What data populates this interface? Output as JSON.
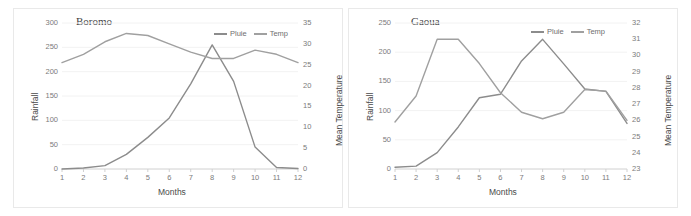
{
  "page": {
    "background_color": "#ffffff",
    "panel_border_color": "#e9e9e9"
  },
  "legend_common": {
    "series_1_label": "Pluie",
    "series_2_label": "Temp"
  },
  "axis_labels": {
    "x": "Months",
    "y_left": "Rainfall",
    "y_right": "Mean Temperature"
  },
  "chart_data": [
    {
      "type": "line",
      "title": "Boromo",
      "xlabel": "Months",
      "ylabel": "Rainfall",
      "y2label": "Mean Temperature",
      "x": [
        1,
        2,
        3,
        4,
        5,
        6,
        7,
        8,
        9,
        10,
        11,
        12
      ],
      "xticklabels": [
        "1",
        "2",
        "3",
        "4",
        "5",
        "6",
        "7",
        "8",
        "9",
        "10",
        "11",
        "12"
      ],
      "ylim": [
        0,
        300
      ],
      "yticks": [
        0,
        50,
        100,
        150,
        200,
        250,
        300
      ],
      "yticklabels": [
        "0",
        "50",
        "100",
        "150",
        "200",
        "250",
        "300"
      ],
      "y2lim": [
        0,
        35
      ],
      "y2ticks": [
        0,
        5,
        10,
        15,
        20,
        25,
        30,
        35
      ],
      "y2ticklabels": [
        "0",
        "5",
        "10",
        "15",
        "20",
        "25",
        "30",
        "35"
      ],
      "grid": true,
      "legend_position": "top-right",
      "series": [
        {
          "name": "Pluie",
          "axis": "left",
          "color": "#8c8c8c",
          "values": [
            0,
            2,
            7,
            30,
            65,
            105,
            175,
            255,
            180,
            45,
            3,
            1
          ]
        },
        {
          "name": "Temp",
          "axis": "right",
          "color": "#a0a0a0",
          "values": [
            25.5,
            27.5,
            30.5,
            32.5,
            32.0,
            30.0,
            28.0,
            26.5,
            26.5,
            28.5,
            27.5,
            25.5
          ]
        }
      ]
    },
    {
      "type": "line",
      "title": "Gaoua",
      "xlabel": "Months",
      "ylabel": "Rainfall",
      "y2label": "Mean Temperature",
      "x": [
        1,
        2,
        3,
        4,
        5,
        6,
        7,
        8,
        9,
        10,
        11,
        12
      ],
      "xticklabels": [
        "1",
        "2",
        "3",
        "4",
        "5",
        "6",
        "7",
        "8",
        "9",
        "10",
        "11",
        "12"
      ],
      "ylim": [
        0,
        250
      ],
      "yticks": [
        0,
        50,
        100,
        150,
        200,
        250
      ],
      "yticklabels": [
        "0",
        "50",
        "100",
        "150",
        "200",
        "250"
      ],
      "y2lim": [
        23,
        32
      ],
      "y2ticks": [
        23,
        24,
        25,
        26,
        27,
        28,
        29,
        30,
        31,
        32
      ],
      "y2ticklabels": [
        "23",
        "24",
        "25",
        "26",
        "27",
        "28",
        "29",
        "30",
        "31",
        "32"
      ],
      "grid": true,
      "legend_position": "top-right",
      "series": [
        {
          "name": "Pluie",
          "axis": "left",
          "color": "#8c8c8c",
          "values": [
            3,
            5,
            28,
            72,
            122,
            128,
            185,
            222,
            180,
            137,
            133,
            78
          ]
        },
        {
          "name": "Temp",
          "axis": "right",
          "color": "#a0a0a0",
          "values": [
            25.9,
            27.5,
            31.0,
            31.0,
            29.5,
            27.7,
            26.5,
            26.1,
            26.5,
            27.9,
            27.8,
            26.0
          ]
        }
      ]
    }
  ]
}
